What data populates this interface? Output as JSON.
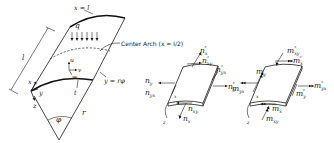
{
  "diagram": {
    "type": "cylindrical-shell-geometry-and-stress-resultants",
    "panels": [
      {
        "id": "shell",
        "labels": {
          "end_edge": "x = l",
          "load": "q",
          "center_arch": "Center Arch  (x = l/2)",
          "length": "l",
          "axis_x": "x",
          "axis_y": "y",
          "axis_z": "z",
          "disp_u": "u",
          "disp_v": "v",
          "disp_w": "w",
          "thickness": "t",
          "arc_coord": "y = rφ",
          "radius": "r",
          "angle": "φ"
        }
      },
      {
        "id": "membrane-forces",
        "labels": {
          "nx_star": {
            "base": "n",
            "sub": "x",
            "sup": "*"
          },
          "nxy_star": {
            "base": "n",
            "sub": "xy",
            "sup": "*"
          },
          "nyx_star": {
            "base": "n",
            "sub": "yx",
            "sup": "*"
          },
          "ny_star": {
            "base": "n",
            "sub": "y",
            "sup": "*"
          },
          "ny": {
            "base": "n",
            "sub": "y"
          },
          "nyx": {
            "base": "n",
            "sub": "yx"
          },
          "nxy": {
            "base": "n",
            "sub": "xy"
          },
          "nx": {
            "base": "n",
            "sub": "x"
          },
          "axis_x": "x",
          "axis_z": "z"
        }
      },
      {
        "id": "moment-resultants",
        "labels": {
          "mxy_star": {
            "base": "m",
            "sub": "xy",
            "sup": "*"
          },
          "mx_star": {
            "base": "m",
            "sub": "x",
            "sup": "*"
          },
          "my": {
            "base": "m",
            "sub": "y"
          },
          "myx": {
            "base": "m",
            "sub": "yx"
          },
          "myx_star": {
            "base": "m",
            "sub": "yx",
            "sup": "*"
          },
          "my_star": {
            "base": "m",
            "sub": "y",
            "sup": "*"
          },
          "mx": {
            "base": "m",
            "sub": "x"
          },
          "mxy": {
            "base": "m",
            "sub": "xy"
          },
          "axis_x": "x",
          "axis_z": "z"
        }
      }
    ],
    "colors": {
      "ink": "#1a1a1a",
      "background": "#ffffff"
    }
  }
}
